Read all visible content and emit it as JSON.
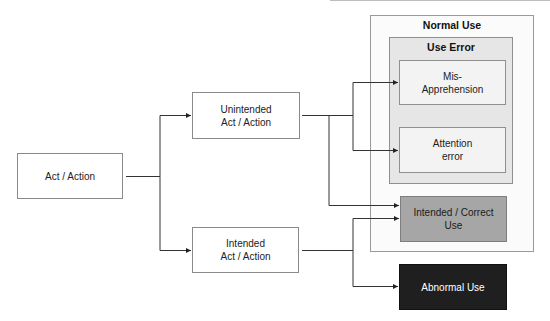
{
  "diagram": {
    "root": {
      "label": "Act / Action"
    },
    "branch_unintended": {
      "label_line1": "Unintended",
      "label_line2": "Act / Action"
    },
    "branch_intended": {
      "label_line1": "Intended",
      "label_line2": "Act / Action"
    },
    "normal_use": {
      "title": "Normal Use",
      "fill": "#fbfbfb"
    },
    "use_error": {
      "title": "Use Error",
      "fill": "#e6e6e6"
    },
    "mis_apprehension": {
      "label_line1": "Mis-",
      "label_line2": "Apprehension"
    },
    "attention_error": {
      "label_line1": "Attention",
      "label_line2": "error"
    },
    "intended_correct": {
      "label_line1": "Intended / Correct",
      "label_line2": "Use",
      "fill": "#a6a6a6"
    },
    "abnormal_use": {
      "label": "Abnormal Use",
      "fill": "#1f1f1f",
      "text_color": "#ffffff"
    },
    "edges": [
      {
        "from": "Act / Action",
        "to": "Unintended Act / Action"
      },
      {
        "from": "Act / Action",
        "to": "Intended Act / Action"
      },
      {
        "from": "Unintended Act / Action",
        "to": "Mis-Apprehension"
      },
      {
        "from": "Unintended Act / Action",
        "to": "Attention error"
      },
      {
        "from": "Unintended Act / Action",
        "to": "Intended / Correct Use"
      },
      {
        "from": "Intended Act / Action",
        "to": "Intended / Correct Use"
      },
      {
        "from": "Intended Act / Action",
        "to": "Abnormal Use"
      }
    ]
  }
}
